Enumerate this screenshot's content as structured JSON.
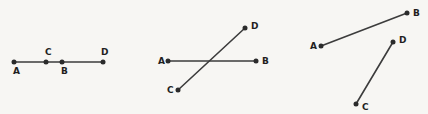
{
  "canvas": {
    "width": 428,
    "height": 114,
    "background_color": "#f7f6f3",
    "stroke_color": "#3c3c3c",
    "point_color": "#2b2b2b",
    "label_color": "#1f1f1f"
  },
  "figures": [
    {
      "id": "figure-1",
      "description": "Four collinear points on a single horizontal line",
      "segments": [
        {
          "name": "segment-AD",
          "x1": 14,
          "y1": 62,
          "x2": 103,
          "y2": 62
        }
      ],
      "points": [
        {
          "label": "A",
          "x": 14,
          "y": 62,
          "label_x": 13,
          "label_y": 74
        },
        {
          "label": "C",
          "x": 46,
          "y": 62,
          "label_x": 45,
          "label_y": 55
        },
        {
          "label": "B",
          "x": 62,
          "y": 62,
          "label_x": 61,
          "label_y": 74
        },
        {
          "label": "D",
          "x": 103,
          "y": 62,
          "label_x": 101,
          "label_y": 55
        }
      ]
    },
    {
      "id": "figure-2",
      "description": "Two intersecting lines: horizontal AB crossed by diagonal CD",
      "segments": [
        {
          "name": "segment-AB",
          "x1": 168,
          "y1": 61,
          "x2": 256,
          "y2": 61
        },
        {
          "name": "segment-CD",
          "x1": 178,
          "y1": 90,
          "x2": 245,
          "y2": 28
        }
      ],
      "points": [
        {
          "label": "A",
          "x": 168,
          "y": 61,
          "label_x": 158,
          "label_y": 64
        },
        {
          "label": "B",
          "x": 256,
          "y": 61,
          "label_x": 262,
          "label_y": 64
        },
        {
          "label": "C",
          "x": 178,
          "y": 90,
          "label_x": 167,
          "label_y": 93
        },
        {
          "label": "D",
          "x": 245,
          "y": 28,
          "label_x": 251,
          "label_y": 29
        }
      ]
    },
    {
      "id": "figure-3",
      "description": "Two separate non-intersecting segments AB and CD",
      "segments": [
        {
          "name": "segment-AB",
          "x1": 321,
          "y1": 46,
          "x2": 407,
          "y2": 13
        },
        {
          "name": "segment-CD",
          "x1": 356,
          "y1": 104,
          "x2": 393,
          "y2": 42
        }
      ],
      "points": [
        {
          "label": "A",
          "x": 321,
          "y": 46,
          "label_x": 310,
          "label_y": 49
        },
        {
          "label": "B",
          "x": 407,
          "y": 13,
          "label_x": 413,
          "label_y": 16
        },
        {
          "label": "C",
          "x": 356,
          "y": 104,
          "label_x": 362,
          "label_y": 110
        },
        {
          "label": "D",
          "x": 393,
          "y": 42,
          "label_x": 399,
          "label_y": 43
        }
      ]
    }
  ]
}
